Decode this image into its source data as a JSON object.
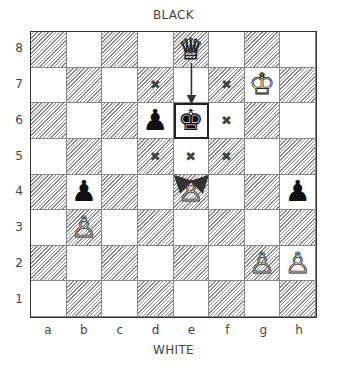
{
  "labels": {
    "top": "BLACK",
    "bottom": "WHITE"
  },
  "ranks": [
    "8",
    "7",
    "6",
    "5",
    "4",
    "3",
    "2",
    "1"
  ],
  "files": [
    "a",
    "b",
    "c",
    "d",
    "e",
    "f",
    "g",
    "h"
  ],
  "pieces": [
    {
      "square": "e8",
      "color": "white",
      "type": "queen",
      "glyph": "♕"
    },
    {
      "square": "g7",
      "color": "white",
      "type": "king",
      "glyph": "♔"
    },
    {
      "square": "e6",
      "color": "black",
      "type": "king",
      "glyph": "♚"
    },
    {
      "square": "d6",
      "color": "black",
      "type": "pawn",
      "glyph": "♟"
    },
    {
      "square": "e4",
      "color": "white",
      "type": "pawn",
      "glyph": "♙"
    },
    {
      "square": "b4",
      "color": "black",
      "type": "pawn",
      "glyph": "♟"
    },
    {
      "square": "h4",
      "color": "black",
      "type": "pawn",
      "glyph": "♟"
    },
    {
      "square": "b3",
      "color": "white",
      "type": "pawn",
      "glyph": "♙"
    },
    {
      "square": "g2",
      "color": "white",
      "type": "pawn",
      "glyph": "♙"
    },
    {
      "square": "h2",
      "color": "white",
      "type": "pawn",
      "glyph": "♙"
    }
  ],
  "marks": [
    {
      "square": "d7",
      "glyph": "✖"
    },
    {
      "square": "f7",
      "glyph": "✖"
    },
    {
      "square": "f6",
      "glyph": "✖"
    },
    {
      "square": "d5",
      "glyph": "✖"
    },
    {
      "square": "e5",
      "glyph": "✖"
    },
    {
      "square": "f5",
      "glyph": "✖"
    }
  ],
  "highlight_square": "e6",
  "arrows": [
    {
      "from": "e8",
      "to": "e6",
      "label": "queen-check-arrow"
    },
    {
      "from": "e4",
      "to": "d5",
      "label": "pawn-attack-arrow-left"
    },
    {
      "from": "e4",
      "to": "f5",
      "label": "pawn-attack-arrow-right"
    }
  ]
}
